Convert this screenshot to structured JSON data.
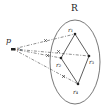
{
  "diagram": {
    "region_label": "R",
    "point_label": "p",
    "point_sub_label": "r₀",
    "vertices": [
      {
        "id": "r1",
        "label": "r₁",
        "x": 75,
        "y": 34
      },
      {
        "id": "r2",
        "label": "r₂",
        "x": 61,
        "y": 58
      },
      {
        "id": "r3",
        "label": "r₃",
        "x": 89,
        "y": 56
      },
      {
        "id": "r4",
        "label": "r₄",
        "x": 78,
        "y": 84
      }
    ],
    "point": {
      "x": 13,
      "y": 49
    },
    "ellipse": {
      "cx": 75,
      "cy": 62,
      "rx": 25,
      "ry": 42
    },
    "colors": {
      "stroke": "#333333",
      "ellipse": "#555555"
    }
  }
}
